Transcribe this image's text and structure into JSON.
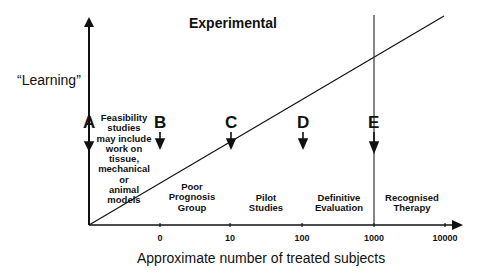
{
  "title": "Experimental",
  "y_axis_label": "“Learning”",
  "x_axis_label": "Approximate number of treated subjects",
  "x_ticks": [
    "0",
    "10",
    "100",
    "1000",
    "10000"
  ],
  "markers": [
    {
      "letter": "A"
    },
    {
      "letter": "B"
    },
    {
      "letter": "C"
    },
    {
      "letter": "D"
    },
    {
      "letter": "E"
    }
  ],
  "phases": [
    {
      "lines": [
        "Feasibility",
        "studies",
        "may include",
        "work on",
        "tissue,",
        "mechanical",
        "or",
        "animal",
        "models"
      ]
    },
    {
      "lines": [
        "Poor",
        "Prognosis",
        "Group"
      ]
    },
    {
      "lines": [
        "Pilot",
        "Studies"
      ]
    },
    {
      "lines": [
        "Definitive",
        "Evaluation"
      ]
    },
    {
      "lines": [
        "Recognised",
        "Therapy"
      ]
    }
  ],
  "colors": {
    "ink": "#111111",
    "background": "#ffffff"
  }
}
